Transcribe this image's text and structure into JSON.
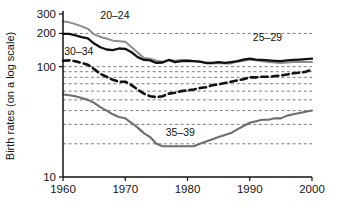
{
  "chart_data": {
    "type": "line",
    "title": "",
    "xlabel": "",
    "ylabel": "Birth rates (on a log scale)",
    "yscale": "log",
    "xlim": [
      1960,
      2000
    ],
    "ylim": [
      10,
      300
    ],
    "grid": true,
    "legend_position": "inline-labels",
    "x_ticks": [
      "1960",
      "1970",
      "1980",
      "1990",
      "2000"
    ],
    "x_tick_values": [
      1960,
      1970,
      1980,
      1990,
      2000
    ],
    "y_ticks": [
      "10",
      "100",
      "200",
      "300"
    ],
    "y_tick_values": [
      10,
      100,
      200,
      300
    ],
    "y_gridline_values": [
      20,
      30,
      40,
      50,
      60,
      70,
      80,
      90,
      100,
      200
    ],
    "x": [
      1960,
      1961,
      1962,
      1963,
      1964,
      1965,
      1966,
      1967,
      1968,
      1969,
      1970,
      1971,
      1972,
      1973,
      1974,
      1975,
      1976,
      1977,
      1978,
      1979,
      1980,
      1981,
      1982,
      1983,
      1984,
      1985,
      1986,
      1987,
      1988,
      1989,
      1990,
      1991,
      1992,
      1993,
      1994,
      1995,
      1996,
      1997,
      1998,
      1999,
      2000
    ],
    "series": [
      {
        "name": "20-24",
        "label": "20–24",
        "color": "#8a8a8a",
        "style": "solid",
        "width": 2.0,
        "label_x": 1966.0,
        "label_y": 270,
        "values": [
          258,
          252,
          243,
          232,
          220,
          196,
          186,
          180,
          172,
          170,
          168,
          151,
          134,
          120,
          118,
          113,
          111,
          115,
          113,
          115,
          115,
          112,
          111,
          107,
          107,
          108,
          107,
          107,
          111,
          113,
          116,
          114,
          112,
          110,
          109,
          108,
          109,
          110,
          111,
          110,
          110
        ]
      },
      {
        "name": "25-29",
        "label": "25–29",
        "color": "#111111",
        "style": "solid",
        "width": 2.3,
        "label_x": 1990.5,
        "label_y": 172,
        "values": [
          198,
          198,
          192,
          185,
          180,
          162,
          150,
          143,
          141,
          146,
          145,
          135,
          122,
          115,
          114,
          108,
          109,
          115,
          110,
          112,
          113,
          112,
          111,
          108,
          108,
          110,
          108,
          110,
          112,
          116,
          118,
          116,
          115,
          114,
          113,
          112,
          114,
          115,
          116,
          117,
          118
        ]
      },
      {
        "name": "30-34",
        "label": "30–34",
        "color": "#111111",
        "style": "dashed",
        "width": 2.6,
        "label_x": 1960.2,
        "label_y": 128,
        "values": [
          113,
          114,
          112,
          108,
          104,
          95,
          86,
          81,
          76,
          73,
          73,
          68,
          62,
          57,
          54,
          53,
          54,
          57,
          58,
          60,
          61,
          62,
          64,
          65,
          68,
          69,
          71,
          73,
          75,
          77,
          80,
          80,
          81,
          81,
          82,
          83,
          85,
          87,
          88,
          90,
          94
        ]
      },
      {
        "name": "35-39",
        "label": "35–39",
        "color": "#6e6e6e",
        "style": "solid",
        "width": 2.1,
        "label_x": 1976.5,
        "label_y": 23.5,
        "values": [
          56,
          55,
          54,
          52,
          50,
          47,
          43,
          40,
          37,
          35,
          34,
          31,
          28,
          25,
          23,
          20,
          19,
          19,
          19,
          19,
          19,
          19,
          20,
          21,
          22,
          23,
          24,
          25,
          27,
          29,
          31,
          32,
          33,
          33,
          34,
          34,
          36,
          37,
          38,
          39,
          40
        ]
      }
    ]
  },
  "geometry": {
    "plot_left": 63,
    "plot_right": 312,
    "plot_top": 14,
    "plot_bottom": 177
  }
}
